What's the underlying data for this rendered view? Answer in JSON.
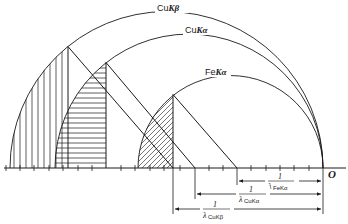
{
  "diagram": {
    "title": "",
    "origin_label": "O",
    "circles": [
      {
        "name": "CuKβ",
        "prefix": "Cu",
        "line": "Kβ",
        "center_x": 166.5,
        "radius": 156.5
      },
      {
        "name": "CuKα",
        "prefix": "Cu",
        "line": "Kα",
        "center_x": 189,
        "radius": 134
      },
      {
        "name": "FeKα",
        "prefix": "Fe",
        "line": "Kα",
        "center_x": 230.5,
        "radius": 92.5
      }
    ],
    "hatching": {
      "CuKβ": "vertical",
      "CuKα": "horizontal",
      "FeKα": "diagonal"
    },
    "reciprocal_labels": [
      {
        "numerator": "1",
        "symbol": "λ",
        "subscript": "FeKα"
      },
      {
        "numerator": "1",
        "symbol": "λ",
        "subscript": "CuKα"
      },
      {
        "numerator": "1",
        "symbol": "λ",
        "subscript": "CuKβ"
      }
    ],
    "stroke_color": "#1a1a1a",
    "background": "#ffffff"
  },
  "labels": {
    "cukb_prefix": "Cu",
    "cukb_line": "Kβ",
    "cuka_prefix": "Cu",
    "cuka_line": "Kα",
    "feka_prefix": "Fe",
    "feka_line": "Kα",
    "origin": "O",
    "one": "1",
    "lambda": "λ",
    "sub_feka": "FeKα",
    "sub_cuka": "CuKα",
    "sub_cukb": "CuKβ"
  }
}
